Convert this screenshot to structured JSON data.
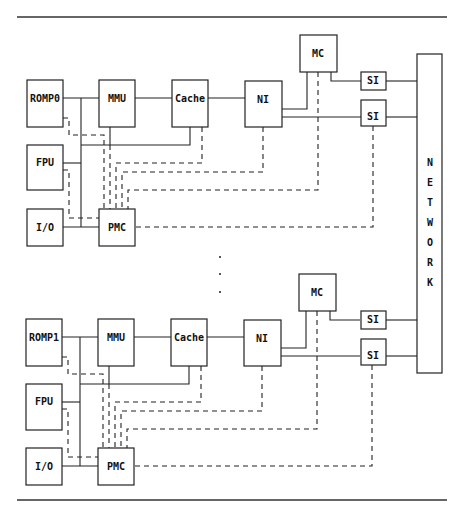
{
  "figure": {
    "network_label": "NETWORK",
    "nodes": [
      {
        "id": "node0",
        "blocks": {
          "romp": "ROMP0",
          "mmu": "MMU",
          "cache": "Cache",
          "ni": "NI",
          "mc": "MC",
          "si_top": "SI",
          "si_bottom": "SI",
          "fpu": "FPU",
          "io": "I/O",
          "pmc": "PMC"
        }
      },
      {
        "id": "node1",
        "blocks": {
          "romp": "ROMP1",
          "mmu": "MMU",
          "cache": "Cache",
          "ni": "NI",
          "mc": "MC",
          "si_top": "SI",
          "si_bottom": "SI",
          "fpu": "FPU",
          "io": "I/O",
          "pmc": "PMC"
        }
      }
    ],
    "ellipsis": "⋮"
  }
}
